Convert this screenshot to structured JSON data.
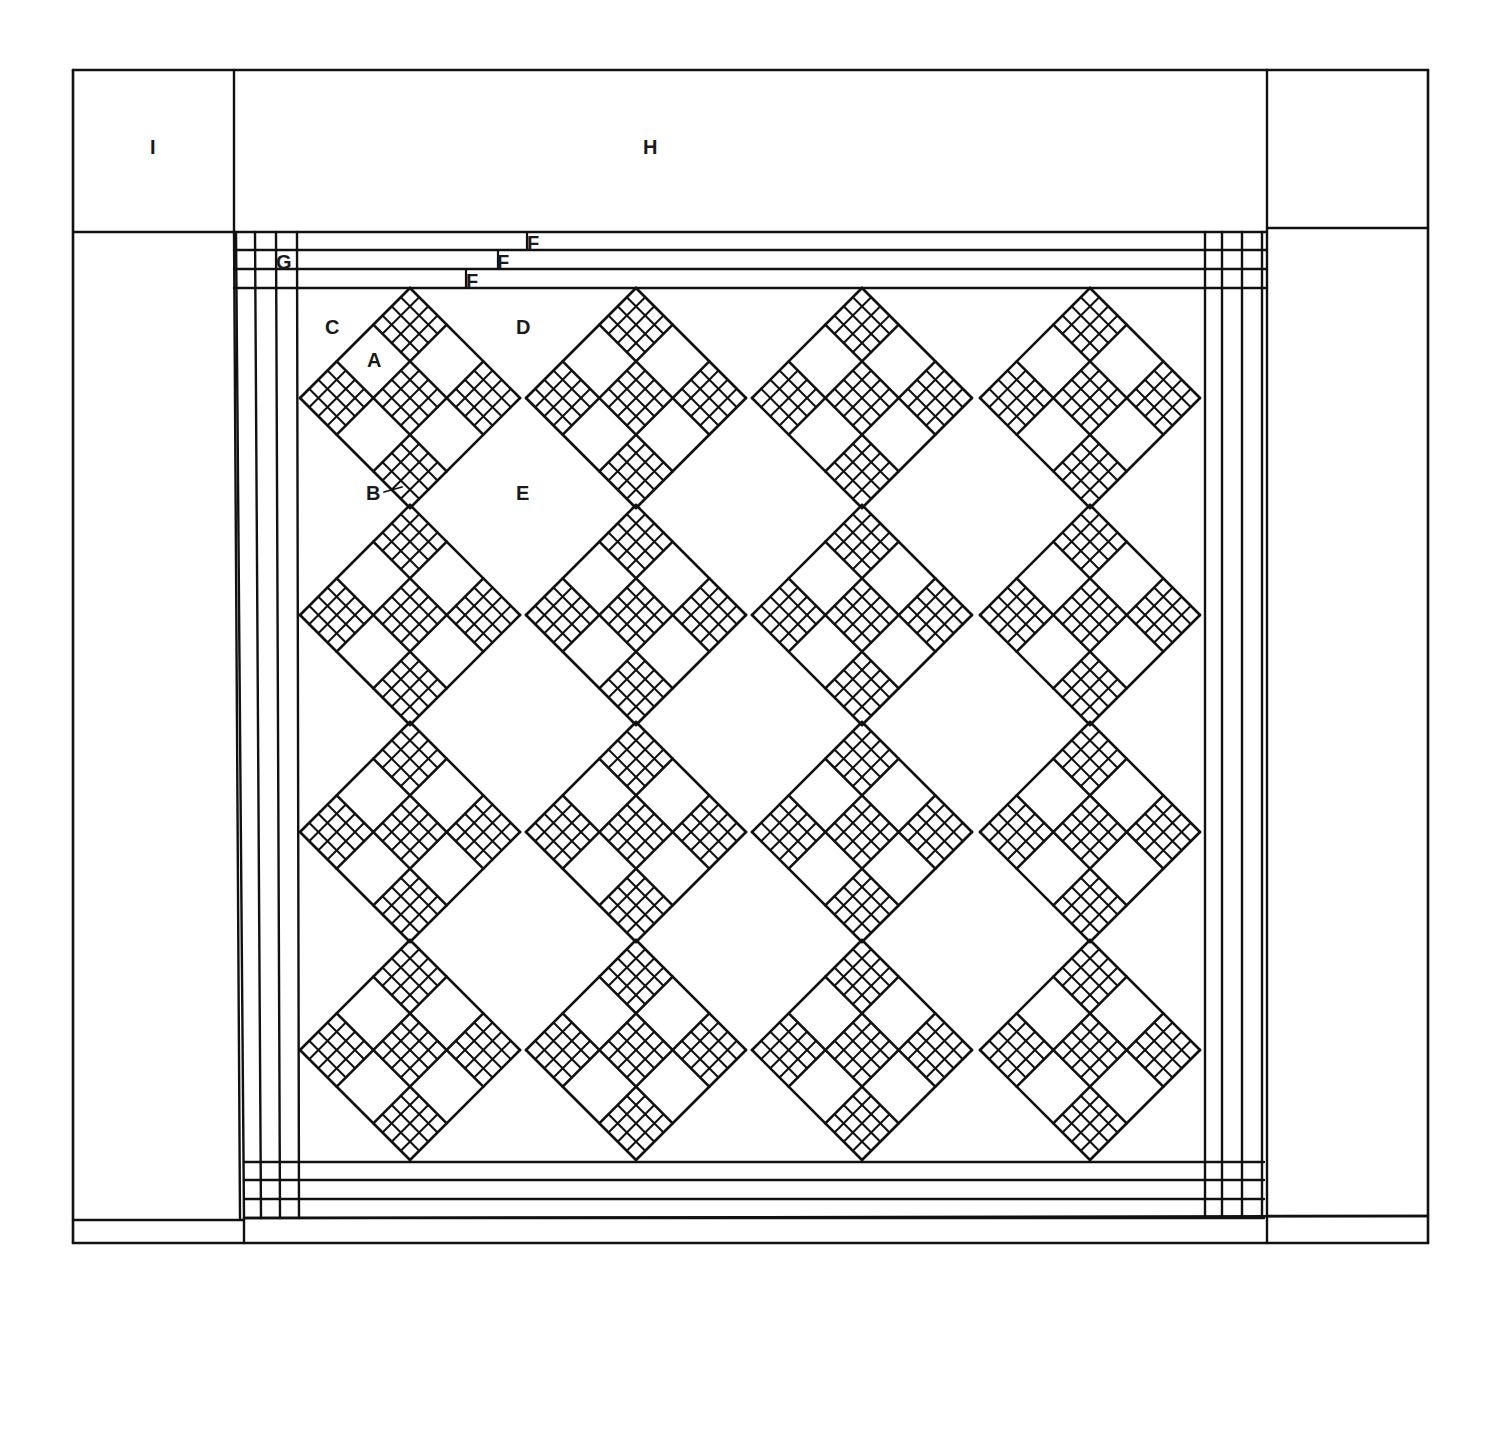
{
  "diagram": {
    "type": "quilt-layout",
    "stroke_color": "#111111",
    "background": "#ffffff"
  },
  "labels": {
    "A": "A",
    "B": "B",
    "C": "C",
    "D": "D",
    "E": "E",
    "F1": "F",
    "F2": "F",
    "F3": "F",
    "G": "G",
    "H": "H",
    "I": "I"
  },
  "layout": {
    "outer": {
      "x1": 73,
      "y1": 70,
      "x2": 1428,
      "y2": 1243
    },
    "corner_col_left": [
      73,
      234
    ],
    "corner_col_right": [
      1267,
      1428
    ],
    "top_band": [
      70,
      228
    ],
    "bottom_band_top": 1218,
    "inner_strips_top": [
      232,
      250,
      269,
      288
    ],
    "inner_strips_bottom": [
      1162,
      1180,
      1199,
      1218
    ],
    "inner_strips_left": [
      240,
      258,
      278,
      298
    ],
    "inner_strips_right": [
      1205,
      1222,
      1242,
      1262
    ],
    "field": {
      "x1": 298,
      "y1": 288,
      "x2": 1205,
      "y2": 1162
    },
    "block_cols": [
      410,
      636,
      862,
      1090
    ],
    "block_rows": [
      398,
      615,
      832,
      1050
    ],
    "block_half_diagonal": 110,
    "checker_cells": 4
  }
}
